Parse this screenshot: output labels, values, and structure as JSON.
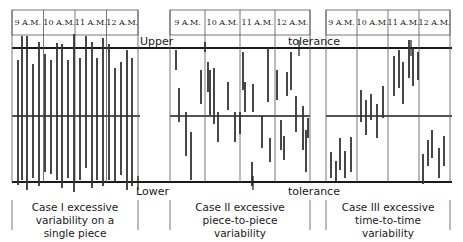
{
  "labels": {
    "upper": "Upper",
    "tolerance_top": "tolerance",
    "lower": "Lower",
    "tolerance_bottom": "tolerance"
  },
  "panels": [
    {
      "hours": [
        "9 A.M.",
        "10 A.M.",
        "11 A.M.",
        "12 A.M."
      ],
      "caption": [
        "Case I excessive",
        "variability on a",
        "single piece"
      ]
    },
    {
      "hours": [
        "9 A.M.",
        "10 A.M.",
        "11 A.M.",
        "12 A.M."
      ],
      "caption": [
        "Case II excessive",
        "piece-to-piece",
        "variability"
      ]
    },
    {
      "hours": [
        "9 A.M.",
        "10 A.M.",
        "11 A.M.",
        "12 A.M."
      ],
      "caption": [
        "Case III excessive",
        "time-to-time",
        "variability"
      ]
    }
  ],
  "colors": {
    "line": "#1a1a1a",
    "grid": "#555555",
    "bar": "#333333"
  }
}
